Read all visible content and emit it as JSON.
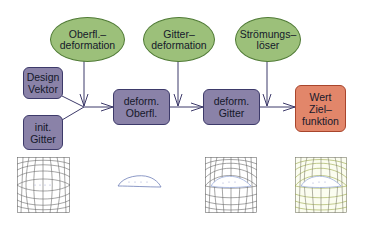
{
  "diagram": {
    "nodes": {
      "surface_deformation": {
        "line1": "Oberfl.–",
        "line2": "deformation",
        "shape": "ellipse",
        "color": "#9cc07a"
      },
      "grid_deformation": {
        "line1": "Gitter–",
        "line2": "deformation",
        "shape": "ellipse",
        "color": "#9cc07a"
      },
      "flow_solver": {
        "line1": "Strömungs–",
        "line2": "löser",
        "shape": "ellipse",
        "color": "#9cc07a"
      },
      "design_vector": {
        "line1": "Design",
        "line2": "Vektor",
        "shape": "rounded-box",
        "color": "#8a82a8"
      },
      "initial_grid": {
        "line1": "init.",
        "line2": "Gitter",
        "shape": "rounded-box",
        "color": "#8a82a8"
      },
      "deformed_surface": {
        "line1": "deform.",
        "line2": "Oberfl.",
        "shape": "rounded-box",
        "color": "#8a82a8"
      },
      "deformed_grid": {
        "line1": "deform.",
        "line2": "Gitter",
        "shape": "rounded-box",
        "color": "#8a82a8"
      },
      "objective_value": {
        "line1": "Wert",
        "line2": "Ziel–",
        "line3": "funktion",
        "shape": "rounded-box",
        "color": "#e2866a"
      }
    },
    "edges": [
      {
        "from": "design_vector",
        "to": "junction_1"
      },
      {
        "from": "initial_grid",
        "to": "junction_1"
      },
      {
        "from": "surface_deformation",
        "to": "junction_1"
      },
      {
        "from": "junction_1",
        "to": "deformed_surface"
      },
      {
        "from": "deformed_surface",
        "to": "junction_2"
      },
      {
        "from": "grid_deformation",
        "to": "junction_2"
      },
      {
        "from": "junction_2",
        "to": "deformed_grid"
      },
      {
        "from": "deformed_grid",
        "to": "junction_3"
      },
      {
        "from": "flow_solver",
        "to": "junction_3"
      },
      {
        "from": "junction_3",
        "to": "objective_value"
      }
    ],
    "thumbnails": [
      {
        "name": "initial-grid-mesh",
        "under": "initial_grid",
        "line_color": "#555555"
      },
      {
        "name": "deformed-airfoil-surface",
        "under": "deformed_surface",
        "line_color": "#6f7fb8"
      },
      {
        "name": "deformed-grid-mesh",
        "under": "deformed_grid",
        "line_color": "#555555"
      },
      {
        "name": "flow-solution-mesh",
        "under": "objective_value",
        "line_color": "#9aa84a"
      }
    ],
    "colors": {
      "ellipse_fill": "#9cc07a",
      "box_fill": "#8a82a8",
      "result_fill": "#e2866a",
      "arrow": "#3d3a6a"
    }
  }
}
